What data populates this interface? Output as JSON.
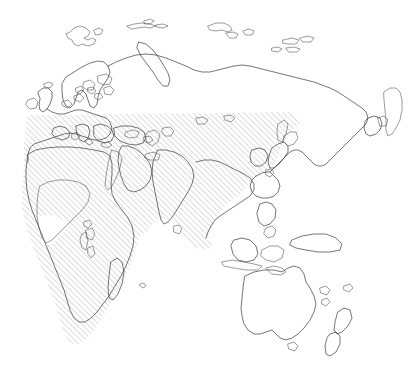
{
  "figure": {
    "type": "distribution-map",
    "title": "",
    "projection_region": "Eurasia, Africa, Australasia",
    "background_color": "#ffffff",
    "coastline_color": "#3a3a3a",
    "hatch_color": "#9a9a9a",
    "hatch_angle_deg": 45,
    "hatch_spacing_px": 4,
    "hatch_line_width_px": 0.7,
    "width_px": 416,
    "height_px": 374
  },
  "legend": {
    "shown": false,
    "entries": [
      {
        "label": "",
        "pattern": "diagonal-hatch",
        "color": "#9a9a9a"
      }
    ]
  },
  "chart_data": {
    "type": "map",
    "title": "",
    "xlabel": "",
    "ylabel": "",
    "regions": [
      {
        "name": "Europe",
        "shaded": true
      },
      {
        "name": "Scandinavia",
        "shaded": false
      },
      {
        "name": "British Isles",
        "shaded": false
      },
      {
        "name": "Mediterranean",
        "shaded": true
      },
      {
        "name": "North Africa",
        "shaded": true
      },
      {
        "name": "Sahara",
        "shaded": true
      },
      {
        "name": "West and Central Africa",
        "shaded": false
      },
      {
        "name": "East Africa",
        "shaded": true
      },
      {
        "name": "Southern Africa",
        "shaded": true
      },
      {
        "name": "Madagascar",
        "shaded": false
      },
      {
        "name": "Arabian Peninsula",
        "shaded": true
      },
      {
        "name": "Middle East",
        "shaded": true
      },
      {
        "name": "Central Asia",
        "shaded": true
      },
      {
        "name": "Siberia",
        "shaded": false
      },
      {
        "name": "India",
        "shaded": true
      },
      {
        "name": "Sri Lanka",
        "shaded": true
      },
      {
        "name": "China",
        "shaded": true
      },
      {
        "name": "Korea",
        "shaded": true
      },
      {
        "name": "Japan",
        "shaded": true
      },
      {
        "name": "Indochina",
        "shaded": true
      },
      {
        "name": "Malay Peninsula",
        "shaded": true
      },
      {
        "name": "Sumatra",
        "shaded": true
      },
      {
        "name": "Borneo",
        "shaded": false
      },
      {
        "name": "Java",
        "shaded": false
      },
      {
        "name": "Philippines",
        "shaded": false
      },
      {
        "name": "New Guinea",
        "shaded": false
      },
      {
        "name": "Australia",
        "shaded": false
      },
      {
        "name": "New Zealand",
        "shaded": false
      },
      {
        "name": "Svalbard",
        "shaded": false
      },
      {
        "name": "Novaya Zemlya",
        "shaded": false
      },
      {
        "name": "Severnaya Zemlya",
        "shaded": false
      },
      {
        "name": "New Siberian Islands",
        "shaded": false
      },
      {
        "name": "Iceland",
        "shaded": false
      },
      {
        "name": "Alaska",
        "shaded": false
      }
    ],
    "shaded_northern_limit_note": "Shaded range terminates along a near-horizontal northern boundary across Europe and Asia"
  }
}
